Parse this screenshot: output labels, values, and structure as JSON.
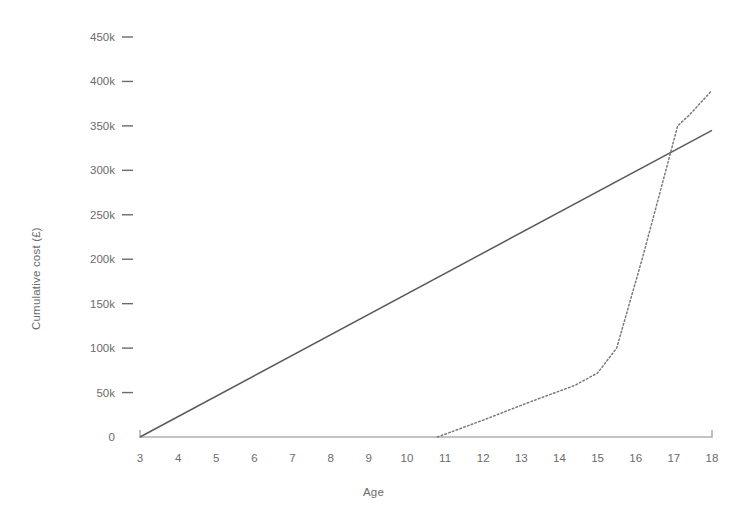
{
  "chart_data": {
    "type": "line",
    "title": "",
    "xlabel": "Age",
    "ylabel": "Cumulative cost (£)",
    "xlim": [
      3,
      18
    ],
    "ylim": [
      0,
      450000
    ],
    "grid": false,
    "legend": "none",
    "x_ticks": [
      3,
      4,
      5,
      6,
      7,
      8,
      9,
      10,
      11,
      12,
      13,
      14,
      15,
      16,
      17,
      18
    ],
    "x_tick_labels": [
      "3",
      "4",
      "5",
      "6",
      "7",
      "8",
      "9",
      "10",
      "11",
      "12",
      "13",
      "14",
      "15",
      "16",
      "17",
      "18"
    ],
    "y_ticks": [
      0,
      50000,
      100000,
      150000,
      200000,
      250000,
      300000,
      350000,
      400000,
      450000
    ],
    "y_tick_labels": [
      "0",
      "50k",
      "100k",
      "150k",
      "200k",
      "250k",
      "300k",
      "350k",
      "400k",
      "450k"
    ],
    "series": [
      {
        "name": "solid-line",
        "style": "solid",
        "color": "#5a5a5a",
        "x": [
          3,
          18
        ],
        "values": [
          0,
          345000
        ]
      },
      {
        "name": "dotted-line",
        "style": "dotted",
        "color": "#7a7a7a",
        "x": [
          10.8,
          12.0,
          13.2,
          14.4,
          15.0,
          15.5,
          16.2,
          17.1,
          17.4,
          18.0
        ],
        "values": [
          0,
          19000,
          39000,
          58000,
          72000,
          100000,
          205000,
          350000,
          362000,
          390000
        ]
      }
    ]
  },
  "axes": {
    "x_title": "Age",
    "y_title": "Cumulative cost (£)"
  },
  "colors": {
    "axis": "#b0b0b0",
    "text": "#6b6b6b",
    "solid_series": "#5a5a5a",
    "dotted_series": "#7a7a7a",
    "background": "#ffffff"
  }
}
